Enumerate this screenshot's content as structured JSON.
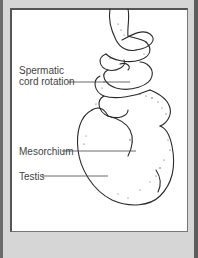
{
  "figure": {
    "labels": [
      {
        "id": "spermatic-cord",
        "line1": "Spermatic",
        "line2": "cord rotation"
      },
      {
        "id": "mesorchium",
        "text": "Mesorchium"
      },
      {
        "id": "testis",
        "text": "Testis"
      }
    ]
  },
  "colors": {
    "frame": "#d6d6d6",
    "panel": "#ffffff",
    "ink": "#333333"
  }
}
